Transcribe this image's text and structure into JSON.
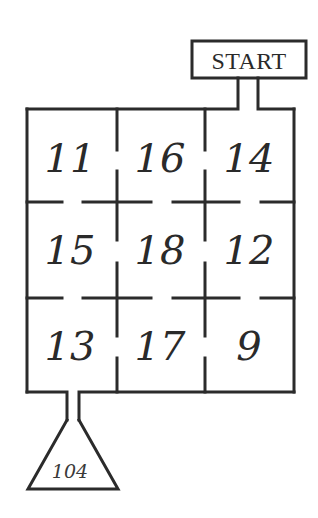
{
  "puzzle": {
    "start_label": "START",
    "goal_value": "104",
    "grid": {
      "rows": 3,
      "cols": 3,
      "cells": [
        [
          "11",
          "16",
          "14"
        ],
        [
          "15",
          "18",
          "12"
        ],
        [
          "13",
          "17",
          "9"
        ]
      ]
    },
    "colors": {
      "wall": "#2b2b2b",
      "background": "#ffffff",
      "text": "#2a2a2a"
    }
  }
}
